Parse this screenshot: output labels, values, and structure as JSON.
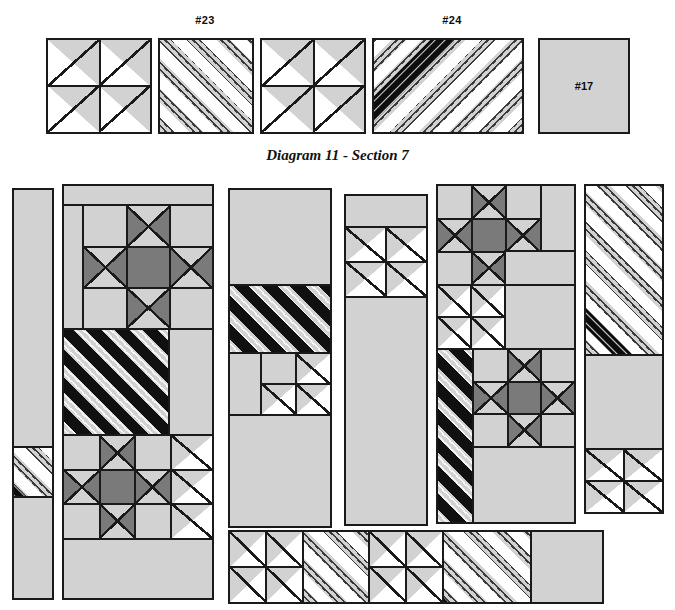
{
  "diagram": {
    "title": "Diagram 11 - Section 7",
    "palette": {
      "background": "#ffffff",
      "outline": "#1a1a1a",
      "light_fabric": "#d2d2d2",
      "white_fabric": "#ffffff",
      "medium_fabric": "#7a7a7a",
      "dark_print": "#101010"
    },
    "top_row": {
      "labels": [
        {
          "text": "#23",
          "x": 205,
          "y": 18
        },
        {
          "text": "#24",
          "x": 452,
          "y": 18
        }
      ],
      "blocks": [
        {
          "name": "four-half-square-triangle-block",
          "fabric": "light-and-white",
          "x": 46,
          "y": 38,
          "w": 106,
          "h": 96
        },
        {
          "name": "striped-square-block-23",
          "fabric": "light-print-stripe",
          "x": 158,
          "y": 38,
          "w": 96,
          "h": 96
        },
        {
          "name": "four-half-square-triangle-block",
          "fabric": "light-and-white",
          "x": 260,
          "y": 38,
          "w": 106,
          "h": 96
        },
        {
          "name": "striped-rectangle-block-24",
          "fabric": "light-print-stripe",
          "x": 372,
          "y": 38,
          "w": 152,
          "h": 96
        },
        {
          "name": "plain-square-block-17",
          "fabric": "light-solid",
          "x": 538,
          "y": 38,
          "w": 92,
          "h": 96,
          "label": "#17"
        }
      ]
    },
    "layout": {
      "section_top": 182,
      "columns": [
        {
          "name": "column-1-narrow-strip",
          "x": 12,
          "y": 188,
          "w": 42,
          "h": 412
        },
        {
          "name": "column-2-star-panel",
          "x": 62,
          "y": 184,
          "w": 152,
          "h": 416
        },
        {
          "name": "column-3-panel",
          "x": 228,
          "y": 188,
          "w": 104,
          "h": 340
        },
        {
          "name": "column-4-panel",
          "x": 344,
          "y": 194,
          "w": 84,
          "h": 332
        },
        {
          "name": "column-5-star-panel",
          "x": 436,
          "y": 184,
          "w": 140,
          "h": 340
        },
        {
          "name": "column-6-panel",
          "x": 584,
          "y": 184,
          "w": 80,
          "h": 330
        },
        {
          "name": "bottom-strip",
          "x": 228,
          "y": 530,
          "w": 376,
          "h": 74
        }
      ]
    },
    "blocks_legend": {
      "ohio_star": "Ohio Star - 3x3 grid, quarter-square-triangle points, solid center",
      "hst": "Half square triangle unit",
      "stripe_dark": "Dark print diagonal stripe",
      "stripe_light": "Light print diagonal stripe",
      "solid": "Solid light fabric"
    }
  }
}
